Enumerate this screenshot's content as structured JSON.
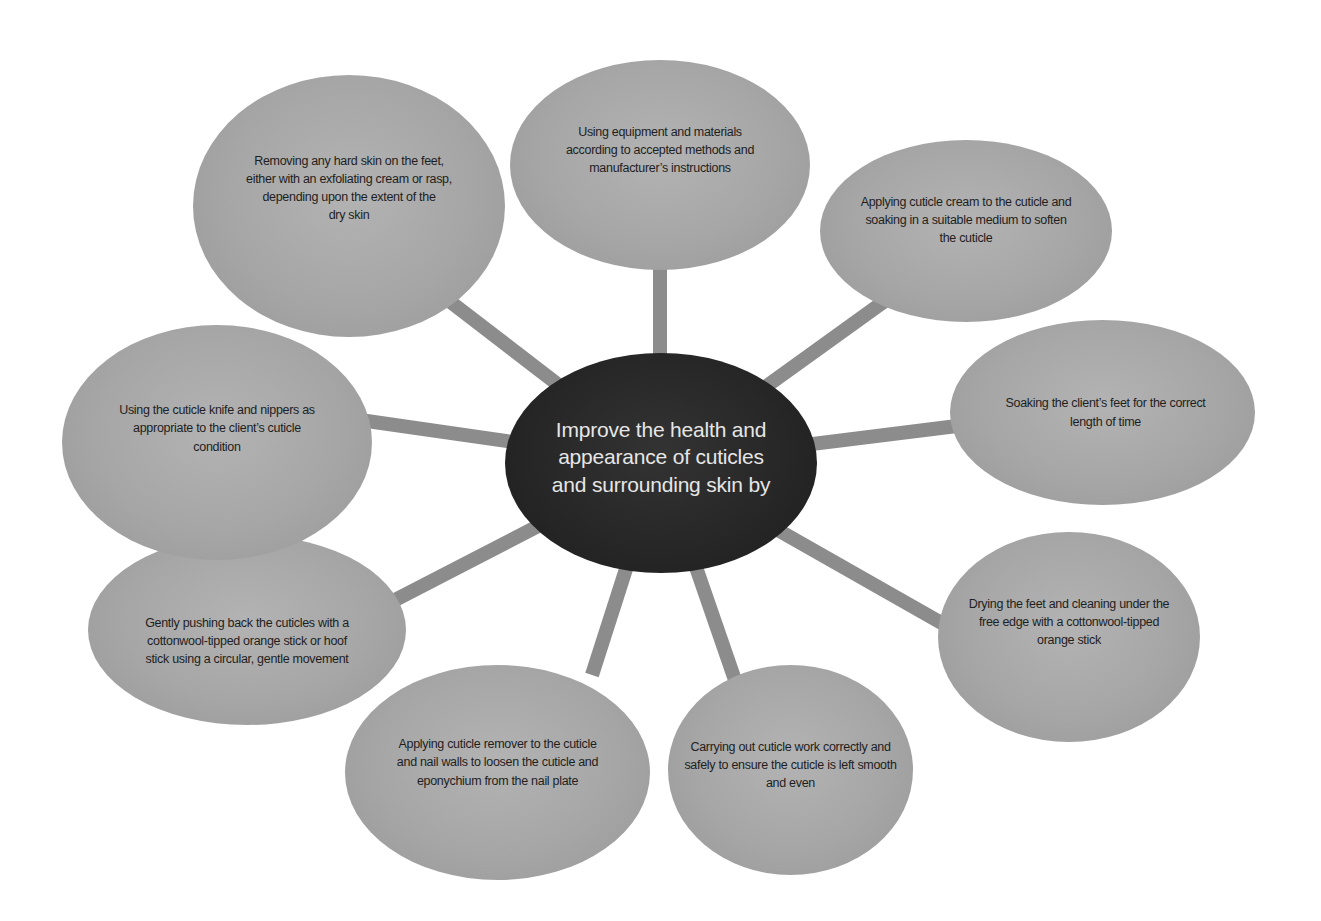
{
  "diagram": {
    "type": "mind-map",
    "colors": {
      "background": "#ffffff",
      "hub_fill": "#262626",
      "hub_text": "#e6e6e6",
      "node_fill": "#a6a6a6",
      "node_text": "#1e1e1e",
      "spoke": "#8c8c8c"
    },
    "hub": {
      "label": "Improve the health and appearance of cuticles and surrounding skin by",
      "lines": [
        "Improve the health and",
        "appearance of cuticles",
        "and surrounding skin by"
      ]
    },
    "nodes": [
      {
        "id": "equipment",
        "lines": [
          "Using equipment and materials",
          "according to accepted methods and",
          "manufacturer’s instructions"
        ]
      },
      {
        "id": "cuticle-cream",
        "lines": [
          "Applying cuticle cream to the cuticle and",
          "soaking in a suitable medium to soften",
          "the cuticle"
        ]
      },
      {
        "id": "soaking",
        "lines": [
          "Soaking the client’s feet for the correct",
          "length of time"
        ]
      },
      {
        "id": "drying",
        "lines": [
          "Drying the feet and cleaning under the",
          "free edge with a cottonwool-tipped",
          "orange stick"
        ]
      },
      {
        "id": "cuticle-work",
        "lines": [
          "Carrying out cuticle work correctly and",
          "safely to ensure the cuticle is left smooth",
          "and even"
        ]
      },
      {
        "id": "cuticle-remover",
        "lines": [
          "Applying cuticle remover to the cuticle",
          "and nail walls to loosen the cuticle and",
          "eponychium from the nail plate"
        ]
      },
      {
        "id": "pushing-back",
        "lines": [
          "Gently pushing back the cuticles with a",
          "cottonwool-tipped orange stick or hoof",
          "stick using a circular, gentle movement"
        ]
      },
      {
        "id": "knife-nippers",
        "lines": [
          "Using the cuticle knife and nippers as",
          "appropriate to the client’s cuticle",
          "condition"
        ]
      },
      {
        "id": "hard-skin",
        "lines": [
          "Removing any hard skin on the feet,",
          "either with an exfoliating cream or rasp,",
          "depending upon the extent of the",
          "dry skin"
        ]
      }
    ]
  }
}
